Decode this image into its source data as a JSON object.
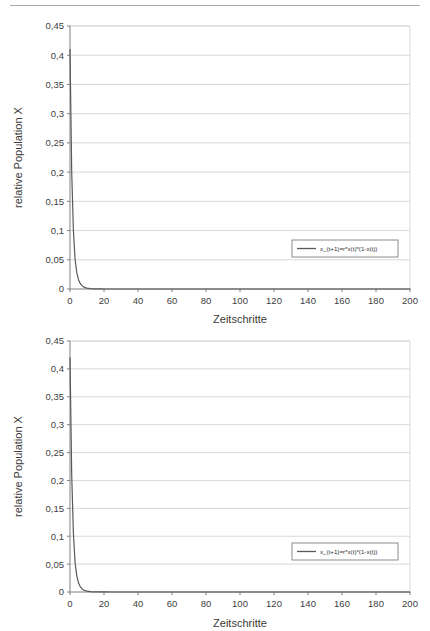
{
  "page": {
    "background_color": "#ffffff",
    "top_rule_color": "#a8a8a8"
  },
  "charts": [
    {
      "id": "chart-top",
      "chart_data": {
        "type": "line",
        "title": "",
        "subtitle": "",
        "xlabel": "Zeitschritte",
        "ylabel": "relative Population X",
        "xlim": [
          0,
          200
        ],
        "ylim": [
          0,
          0.45
        ],
        "grid": true,
        "grid_color": "#d9d9d9",
        "axis_color": "#808080",
        "legend_position": "inside-right-lower",
        "xticks": [
          0,
          20,
          40,
          60,
          80,
          100,
          120,
          140,
          160,
          180,
          200
        ],
        "xtick_labels": [
          "0",
          "20",
          "40",
          "60",
          "80",
          "100",
          "120",
          "140",
          "160",
          "180",
          "200"
        ],
        "yticks": [
          0,
          0.05,
          0.1,
          0.15,
          0.2,
          0.25,
          0.3,
          0.35,
          0.4,
          0.45
        ],
        "ytick_labels": [
          "0",
          "0,05",
          "0,1",
          "0,15",
          "0,2",
          "0,25",
          "0,3",
          "0,35",
          "0,4",
          "0,45"
        ],
        "series": [
          {
            "name": "x_(t+1)=r*x(t)*(1-x(t))",
            "color": "#595959",
            "x": [
              0,
              1,
              2,
              3,
              4,
              5,
              6,
              7,
              8,
              9,
              10,
              12,
              14,
              16,
              18,
              20,
              25,
              30,
              40,
              50,
              60,
              80,
              100,
              120,
              140,
              160,
              180,
              200
            ],
            "y": [
              0.41,
              0.2,
              0.1,
              0.05,
              0.028,
              0.016,
              0.0095,
              0.0058,
              0.0036,
              0.0023,
              0.0015,
              0.0007,
              0.0003,
              0.00015,
              8e-05,
              4e-05,
              1e-05,
              4e-06,
              6e-07,
              1e-07,
              2e-08,
              0,
              0,
              0,
              0,
              0,
              0,
              0
            ]
          }
        ]
      },
      "legend": {
        "label": "x_(t+1)=r*x(t)*(1-x(t))",
        "border_color": "#8c8c8c",
        "line_color": "#595959"
      }
    },
    {
      "id": "chart-bottom",
      "chart_data": {
        "type": "line",
        "title": "",
        "subtitle": "",
        "xlabel": "Zeitschritte",
        "ylabel": "relative Population X",
        "xlim": [
          0,
          200
        ],
        "ylim": [
          0,
          0.45
        ],
        "grid": true,
        "grid_color": "#d9d9d9",
        "axis_color": "#808080",
        "legend_position": "inside-right-lower",
        "xticks": [
          0,
          20,
          40,
          60,
          80,
          100,
          120,
          140,
          160,
          180,
          200
        ],
        "xtick_labels": [
          "0",
          "20",
          "40",
          "60",
          "80",
          "100",
          "120",
          "140",
          "160",
          "180",
          "200"
        ],
        "yticks": [
          0,
          0.05,
          0.1,
          0.15,
          0.2,
          0.25,
          0.3,
          0.35,
          0.4,
          0.45
        ],
        "ytick_labels": [
          "0",
          "0,05",
          "0,1",
          "0,15",
          "0,2",
          "0,25",
          "0,3",
          "0,35",
          "0,4",
          "0,45"
        ],
        "series": [
          {
            "name": "x_(t+1)=r*x(t)*(1-x(t))",
            "color": "#595959",
            "x": [
              0,
              1,
              2,
              3,
              4,
              5,
              6,
              7,
              8,
              9,
              10,
              12,
              14,
              16,
              18,
              20,
              25,
              30,
              40,
              50,
              60,
              80,
              100,
              120,
              140,
              160,
              180,
              200
            ],
            "y": [
              0.42,
              0.21,
              0.105,
              0.052,
              0.029,
              0.0165,
              0.0098,
              0.006,
              0.0037,
              0.0024,
              0.0016,
              0.00075,
              0.00035,
              0.00016,
              9e-05,
              5e-05,
              1.2e-05,
              5e-06,
              7e-07,
              1e-07,
              2e-08,
              0,
              0,
              0,
              0,
              0,
              0,
              0
            ]
          }
        ]
      },
      "legend": {
        "label": "x_(t+1)=r*x(t)*(1-x(t))",
        "border_color": "#8c8c8c",
        "line_color": "#595959"
      }
    }
  ]
}
